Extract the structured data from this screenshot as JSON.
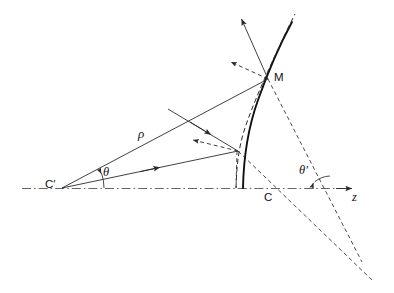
{
  "figure": {
    "type": "optics-ray-diagram",
    "background": "#ffffff",
    "stroke_color": "#2b2b2b",
    "width": 394,
    "height": 293
  },
  "labels": {
    "c_prime": "C′",
    "c": "C",
    "m": "M",
    "rho": "ρ",
    "theta": "θ",
    "theta_prime": "θ′",
    "z_axis": "z"
  },
  "geometry": {
    "optical_axis": {
      "y": 188,
      "x_start": 22,
      "x_end": 352,
      "style": "dash-dot"
    },
    "center_c_prime": {
      "x": 62,
      "y": 188
    },
    "vertex_c": {
      "x": 268,
      "y": 188
    },
    "point_m": {
      "x": 268,
      "y": 79
    },
    "mirror_apex_solid": {
      "x": 243,
      "y": 188
    },
    "mirror_apex_dashed": {
      "x": 236,
      "y": 188
    },
    "reflection_point_lower": {
      "x": 236,
      "y": 151
    },
    "theta_arc_radius": 42,
    "theta_prime_vertex": {
      "x": 312,
      "y": 188
    },
    "theta_prime_arc_radius": 26,
    "dashed_convergence": {
      "x": 359,
      "y": 257
    }
  }
}
